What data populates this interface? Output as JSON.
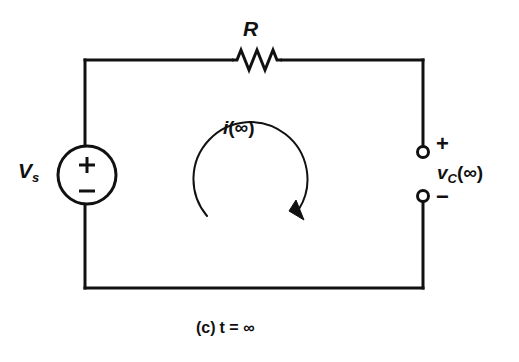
{
  "figure": {
    "domain_type": "circuit-diagram",
    "caption_part": "(c)",
    "caption_condition": "t = ∞",
    "caption_full": "(c)  t = ∞",
    "background_color": "#ffffff",
    "line_color": "#111111"
  },
  "labels": {
    "source_symbol": "V",
    "source_subscript": "s",
    "source_polarity_plus": "+",
    "source_polarity_minus": "−",
    "resistor": "R",
    "current_var": "i",
    "current_arg": "(∞)",
    "cap_voltage_var": "v",
    "cap_voltage_sub": "C",
    "cap_voltage_arg": "(∞)",
    "terminal_plus": "+",
    "terminal_minus": "−"
  },
  "components": [
    {
      "name": "voltage-source",
      "type": "independent-dc-source",
      "label": "Vs",
      "shape": "circle",
      "cx": 87,
      "cy": 175,
      "r": 29
    },
    {
      "name": "resistor",
      "type": "resistor",
      "label": "R",
      "shape": "zigzag",
      "x_start": 232,
      "x_end": 282,
      "y": 60
    },
    {
      "name": "output-terminals",
      "type": "open-terminal-pair",
      "label": "vC(inf)",
      "top_terminal": {
        "cx": 423,
        "cy": 152,
        "r": 5
      },
      "bottom_terminal": {
        "cx": 423,
        "cy": 196,
        "r": 5
      }
    },
    {
      "name": "mesh-current-arrow",
      "type": "clockwise-current-loop",
      "label": "i(inf)",
      "cx": 255,
      "cy": 173,
      "r": 57,
      "direction": "clockwise"
    }
  ],
  "wires": {
    "left_x": 85,
    "right_x": 423,
    "top_y": 60,
    "bottom_y": 288
  }
}
